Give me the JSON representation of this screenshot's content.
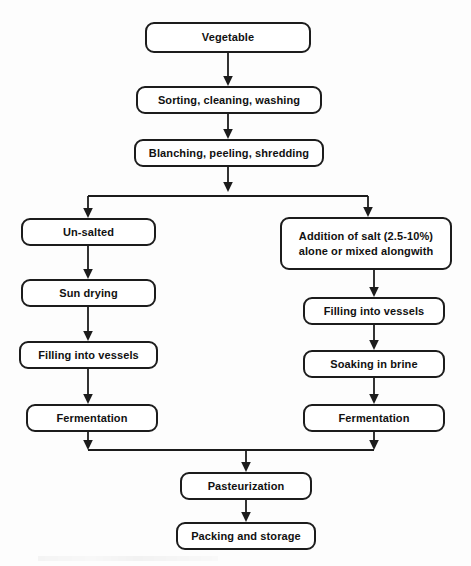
{
  "diagram": {
    "background_color": "#fdfdfd",
    "line_color": "#1c1c1c",
    "box_fill_color": "#ffffff",
    "nodes": [
      {
        "id": "vegetable",
        "label": "Vegetable",
        "x": 145,
        "y": 22,
        "w": 166,
        "h": 31
      },
      {
        "id": "sorting",
        "label": "Sorting, cleaning, washing",
        "x": 136,
        "y": 86,
        "w": 186,
        "h": 28
      },
      {
        "id": "blanching",
        "label": "Blanching, peeling, shredding",
        "x": 134,
        "y": 139,
        "w": 190,
        "h": 28
      },
      {
        "id": "unsalted",
        "label": "Un-salted",
        "x": 21,
        "y": 218,
        "w": 135,
        "h": 28
      },
      {
        "id": "salt-addition",
        "label": "Addition of salt (2.5-10%)\nalone or mixed alongwith",
        "x": 280,
        "y": 217,
        "w": 172,
        "h": 53
      },
      {
        "id": "sun-drying",
        "label": "Sun drying",
        "x": 21,
        "y": 279,
        "w": 135,
        "h": 28
      },
      {
        "id": "filling-left",
        "label": "Filling into vessels",
        "x": 19,
        "y": 341,
        "w": 139,
        "h": 28
      },
      {
        "id": "filling-right",
        "label": "Filling into vessels",
        "x": 303,
        "y": 297,
        "w": 142,
        "h": 28
      },
      {
        "id": "soaking",
        "label": "Soaking in brine",
        "x": 303,
        "y": 350,
        "w": 142,
        "h": 28
      },
      {
        "id": "fermentation-left",
        "label": "Fermentation",
        "x": 26,
        "y": 404,
        "w": 132,
        "h": 28
      },
      {
        "id": "fermentation-right",
        "label": "Fermentation",
        "x": 303,
        "y": 404,
        "w": 142,
        "h": 28
      },
      {
        "id": "pasteurization",
        "label": "Pasteurization",
        "x": 180,
        "y": 472,
        "w": 132,
        "h": 28
      },
      {
        "id": "packing",
        "label": "Packing and storage",
        "x": 176,
        "y": 522,
        "w": 140,
        "h": 28
      }
    ],
    "connectors": [
      {
        "id": "vegetable-to-sorting",
        "from": "vegetable",
        "to": "sorting",
        "type": "straight-arrow"
      },
      {
        "id": "sorting-to-blanching",
        "from": "sorting",
        "to": "blanching",
        "type": "straight-arrow"
      },
      {
        "id": "blanching-to-split",
        "from": "blanching",
        "to": "split-bus",
        "type": "straight-arrow"
      },
      {
        "id": "split-to-unsalted",
        "from": "split-bus",
        "to": "unsalted",
        "type": "elbow-arrow"
      },
      {
        "id": "split-to-salt-addition",
        "from": "split-bus",
        "to": "salt-addition",
        "type": "elbow-arrow"
      },
      {
        "id": "unsalted-to-sun-drying",
        "from": "unsalted",
        "to": "sun-drying",
        "type": "straight-arrow"
      },
      {
        "id": "sun-drying-to-filling-left",
        "from": "sun-drying",
        "to": "filling-left",
        "type": "straight-arrow"
      },
      {
        "id": "filling-left-to-fermentation",
        "from": "filling-left",
        "to": "fermentation-left",
        "type": "straight-arrow"
      },
      {
        "id": "salt-to-filling-right",
        "from": "salt-addition",
        "to": "filling-right",
        "type": "straight-arrow"
      },
      {
        "id": "filling-right-to-soaking",
        "from": "filling-right",
        "to": "soaking",
        "type": "straight-arrow"
      },
      {
        "id": "soaking-to-fermentation-right",
        "from": "soaking",
        "to": "fermentation-right",
        "type": "straight-arrow"
      },
      {
        "id": "fermentation-left-to-merge",
        "from": "fermentation-left",
        "to": "merge-bus",
        "type": "straight-arrow"
      },
      {
        "id": "fermentation-right-to-merge",
        "from": "fermentation-right",
        "to": "merge-bus",
        "type": "straight-arrow"
      },
      {
        "id": "merge-to-pasteurization",
        "from": "merge-bus",
        "to": "pasteurization",
        "type": "straight-arrow"
      },
      {
        "id": "pasteurization-to-packing",
        "from": "pasteurization",
        "to": "packing",
        "type": "straight-arrow"
      }
    ]
  }
}
